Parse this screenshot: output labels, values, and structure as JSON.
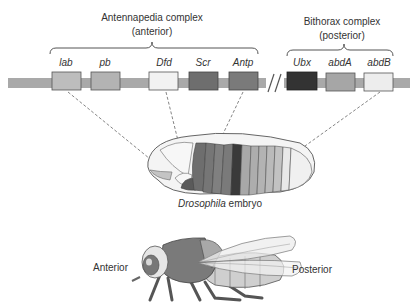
{
  "complexes": {
    "antennapedia": {
      "title": "Antennapedia  complex",
      "subtitle": "(anterior)"
    },
    "bithorax": {
      "title": "Bithorax  complex",
      "subtitle": "(posterior)"
    }
  },
  "genes": [
    {
      "name": "lab",
      "color": "#bdbdbd"
    },
    {
      "name": "pb",
      "color": "#b3b3b3"
    },
    {
      "name": "Dfd",
      "color": "#f2f2f2"
    },
    {
      "name": "Scr",
      "color": "#6e6e6e"
    },
    {
      "name": "Antp",
      "color": "#7a7a7a"
    },
    {
      "name": "Ubx",
      "color": "#333333"
    },
    {
      "name": "abdA",
      "color": "#a6a6a6"
    },
    {
      "name": "abdB",
      "color": "#ededed"
    }
  ],
  "embryo": {
    "label_italic": "Drosophila",
    "label_rest": " embryo"
  },
  "fly": {
    "anterior": "Anterior",
    "posterior": "Posterior"
  },
  "colors": {
    "chromosome": "#a9a9a9",
    "outline": "#555555"
  }
}
